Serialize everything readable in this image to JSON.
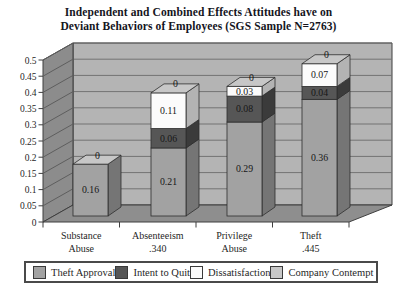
{
  "chart_data": {
    "type": "bar",
    "subtype": "3d-stacked-column",
    "title": "Independent and Combined Effects Attitudes have on Deviant Behaviors of Employees (SGS Sample N=2763)",
    "title_lines": [
      "Independent and Combined Effects Attitudes have on",
      "Deviant Behaviors of Employees (SGS Sample N=2763)"
    ],
    "categories": [
      {
        "line1": "Substance",
        "line2": "Abuse"
      },
      {
        "line1": "Absenteeism",
        "line2": ".340"
      },
      {
        "line1": "Privilege",
        "line2": "Abuse"
      },
      {
        "line1": "Theft",
        "line2": ".445"
      }
    ],
    "series": [
      {
        "name": "Theft Approval",
        "color_front": "#a2a2a2",
        "color_side": "#757575",
        "values": [
          0.16,
          0.21,
          0.29,
          0.36
        ]
      },
      {
        "name": "Intent to Quit",
        "color_front": "#565656",
        "color_side": "#3b3b3b",
        "values": [
          0,
          0.06,
          0.08,
          0.04
        ]
      },
      {
        "name": "Dissatisfaction",
        "color_front": "#fbfbfb",
        "color_side": "#b3b3b3",
        "values": [
          0,
          0.11,
          0.03,
          0.07
        ]
      },
      {
        "name": "Company Contempt",
        "color_front": "#c7c7c7",
        "color_side": "#8f8f8f",
        "values": [
          0,
          0,
          0,
          0
        ]
      }
    ],
    "segment_labels": [
      [
        "0.16",
        "0.21",
        "0.29",
        "0.36"
      ],
      [
        "",
        "0.06",
        "0.08",
        "0.04"
      ],
      [
        "",
        "0.11",
        "0.03",
        "0.07"
      ],
      [
        "0",
        "0",
        "0",
        "0"
      ]
    ],
    "ylim": [
      0,
      0.5
    ],
    "ytick_step": 0.05,
    "ytick_labels": [
      "0",
      "0.05",
      "0.1",
      "0.15",
      "0.2",
      "0.25",
      "0.3",
      "0.35",
      "0.4",
      "0.45",
      "0.5"
    ],
    "legend_position": "bottom",
    "grid": true,
    "palette": {
      "background": "#ffffff",
      "wall_back": "#b4b4b4",
      "wall_left": "#8c8c8c",
      "floor": "#8e8e8e",
      "grid_back": "#737373",
      "grid_left": "#5e5e5e",
      "outline": "#3f3f3f",
      "segment_outline": "#2e2e2e",
      "text": "#1f1f1f",
      "title_text": "#15151d",
      "legend_border": "#4a4a4a"
    }
  }
}
